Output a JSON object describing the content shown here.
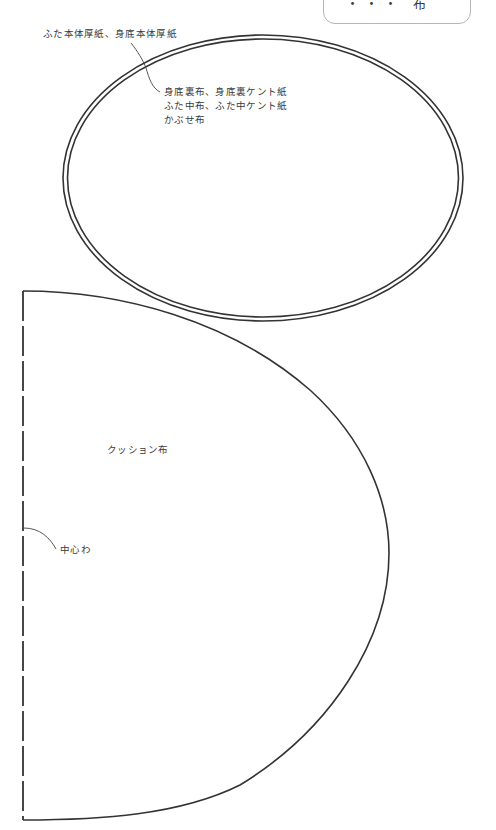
{
  "title_box": {
    "text": "・・・ 布"
  },
  "oval_pattern": {
    "outer_label": "ふた本体厚紙、身底本体厚紙",
    "inner_label_lines": [
      "身底裏布、身底裏ケント紙",
      "ふた中布、ふた中ケント紙",
      "かぶせ布"
    ],
    "colors": {
      "line": "#333333"
    }
  },
  "cushion_pattern": {
    "label": "クッション布",
    "center_label": "中心わ",
    "colors": {
      "line": "#333333"
    }
  }
}
